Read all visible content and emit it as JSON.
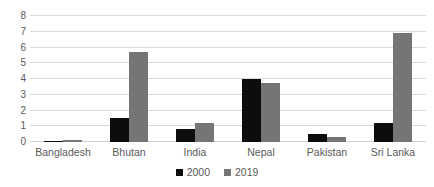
{
  "chart_data": {
    "type": "bar",
    "title": "",
    "subtitle": "",
    "xlabel": "",
    "ylabel": "",
    "categories": [
      "Bangladesh",
      "Bhutan",
      "India",
      "Nepal",
      "Pakistan",
      "Sri Lanka"
    ],
    "series": [
      {
        "name": "2000",
        "color": "#0d0d0d",
        "values": [
          0.05,
          1.5,
          0.8,
          4.0,
          0.5,
          1.2
        ]
      },
      {
        "name": "2019",
        "color": "#757575",
        "values": [
          0.15,
          5.7,
          1.2,
          3.75,
          0.3,
          6.9
        ]
      }
    ],
    "ylim": [
      0,
      8
    ],
    "yticks": [
      0,
      1,
      2,
      3,
      4,
      5,
      6,
      7,
      8
    ],
    "ytick_labels": [
      "0",
      "1",
      "2",
      "3",
      "4",
      "5",
      "6",
      "7",
      "8"
    ],
    "grid": true,
    "grid_axis": "y",
    "legend": true,
    "legend_position": "bottom",
    "legend_entries": [
      "2000",
      "2019"
    ],
    "background_color": "#ffffff",
    "gridline_color": "#d9d9d9",
    "text_color": "#5a5a5a"
  }
}
